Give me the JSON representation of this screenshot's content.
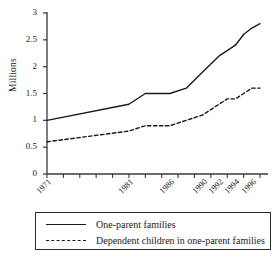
{
  "chart_data": {
    "type": "line",
    "title": "",
    "xlabel": "",
    "ylabel": "Millions",
    "ylim": [
      0,
      3
    ],
    "yticks": [
      0,
      0.5,
      1,
      1.5,
      2,
      2.5,
      3
    ],
    "ytick_labels": [
      "0",
      "0.5",
      "1",
      "1.5",
      "2",
      "2.5",
      "3"
    ],
    "grid": false,
    "legend_position": "below-axes",
    "x": [
      1971,
      1981,
      1983,
      1986,
      1988,
      1990,
      1991,
      1992,
      1993,
      1994,
      1995,
      1996,
      1997
    ],
    "xticks": [
      1971,
      1981,
      1986,
      1990,
      1992,
      1994,
      1996
    ],
    "xtick_labels": [
      "1971",
      "1981",
      "1986",
      "1990",
      "1992",
      "1994",
      "1996"
    ],
    "series": [
      {
        "name": "One-parent families",
        "style": "solid",
        "color": "#1a1a1a",
        "values": [
          1.0,
          1.3,
          1.5,
          1.5,
          1.6,
          1.9,
          2.05,
          2.2,
          2.3,
          2.4,
          2.6,
          2.72,
          2.8
        ]
      },
      {
        "name": "Dependent children in one-parent families",
        "style": "dashed",
        "color": "#1a1a1a",
        "values": [
          0.6,
          0.8,
          0.9,
          0.9,
          1.0,
          1.1,
          1.2,
          1.3,
          1.4,
          1.4,
          1.5,
          1.6,
          1.6
        ]
      }
    ]
  },
  "axes": {
    "ylabel": "Millions"
  },
  "legend": {
    "items": [
      {
        "label": "One-parent families",
        "style": "solid"
      },
      {
        "label": "Dependent children in one-parent families",
        "style": "dashed"
      }
    ]
  }
}
